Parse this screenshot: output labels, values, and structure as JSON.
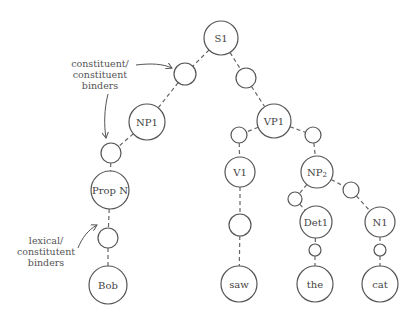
{
  "diagram": {
    "type": "parse-tree",
    "nodes": [
      {
        "id": "S1",
        "label": "S1",
        "x": 221,
        "y": 38,
        "r": 17
      },
      {
        "id": "b1",
        "label": "",
        "x": 185,
        "y": 74,
        "r": 11
      },
      {
        "id": "b2",
        "label": "",
        "x": 246,
        "y": 78,
        "r": 10
      },
      {
        "id": "NP1",
        "label": "NP1",
        "x": 147,
        "y": 122,
        "r": 18
      },
      {
        "id": "b3",
        "label": "",
        "x": 111,
        "y": 153,
        "r": 10
      },
      {
        "id": "PropN",
        "label": "Prop N",
        "x": 110,
        "y": 190,
        "r": 19
      },
      {
        "id": "b4",
        "label": "",
        "x": 108,
        "y": 238,
        "r": 10
      },
      {
        "id": "Bob",
        "label": "Bob",
        "x": 108,
        "y": 285,
        "r": 19
      },
      {
        "id": "VP1",
        "label": "VP1",
        "x": 274,
        "y": 121,
        "r": 17
      },
      {
        "id": "b5",
        "label": "",
        "x": 239,
        "y": 135,
        "r": 8
      },
      {
        "id": "b6",
        "label": "",
        "x": 313,
        "y": 135,
        "r": 8
      },
      {
        "id": "V1",
        "label": "V1",
        "x": 240,
        "y": 172,
        "r": 15
      },
      {
        "id": "b7",
        "label": "",
        "x": 240,
        "y": 225,
        "r": 11
      },
      {
        "id": "saw",
        "label": "saw",
        "x": 239,
        "y": 284,
        "r": 18
      },
      {
        "id": "NP2",
        "label": "NP",
        "sub": "2",
        "x": 317,
        "y": 172,
        "r": 16
      },
      {
        "id": "b8",
        "label": "",
        "x": 295,
        "y": 199,
        "r": 7
      },
      {
        "id": "b9",
        "label": "",
        "x": 351,
        "y": 190,
        "r": 8
      },
      {
        "id": "Det1",
        "label": "Det1",
        "x": 316,
        "y": 222,
        "r": 16
      },
      {
        "id": "b10",
        "label": "",
        "x": 315,
        "y": 250,
        "r": 6
      },
      {
        "id": "the",
        "label": "the",
        "x": 315,
        "y": 284,
        "r": 18
      },
      {
        "id": "N1",
        "label": "N1",
        "x": 380,
        "y": 222,
        "r": 15
      },
      {
        "id": "b11",
        "label": "",
        "x": 380,
        "y": 250,
        "r": 6
      },
      {
        "id": "cat",
        "label": "cat",
        "x": 380,
        "y": 284,
        "r": 18
      }
    ],
    "edges": [
      [
        "S1",
        "b1"
      ],
      [
        "b1",
        "NP1"
      ],
      [
        "S1",
        "b2"
      ],
      [
        "b2",
        "VP1"
      ],
      [
        "NP1",
        "b3"
      ],
      [
        "b3",
        "PropN"
      ],
      [
        "PropN",
        "b4"
      ],
      [
        "b4",
        "Bob"
      ],
      [
        "VP1",
        "b5"
      ],
      [
        "b5",
        "V1"
      ],
      [
        "VP1",
        "b6"
      ],
      [
        "b6",
        "NP2"
      ],
      [
        "V1",
        "b7"
      ],
      [
        "b7",
        "saw"
      ],
      [
        "NP2",
        "b8"
      ],
      [
        "b8",
        "Det1"
      ],
      [
        "NP2",
        "b9"
      ],
      [
        "b9",
        "N1"
      ],
      [
        "Det1",
        "b10"
      ],
      [
        "b10",
        "the"
      ],
      [
        "N1",
        "b11"
      ],
      [
        "b11",
        "cat"
      ]
    ],
    "annotations": [
      {
        "id": "constituent",
        "lines": [
          "constituent/",
          "constituent",
          "binders"
        ],
        "x": 100,
        "y": 67
      },
      {
        "id": "lexical",
        "lines": [
          "lexical/",
          "constitutent",
          "binders"
        ],
        "x": 46,
        "y": 244
      }
    ]
  }
}
